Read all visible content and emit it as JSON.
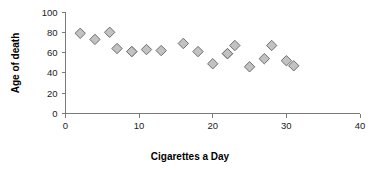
{
  "chart_data": {
    "type": "scatter",
    "title": "",
    "xlabel": "Cigarettes a Day",
    "ylabel": "Age of death",
    "xlim": [
      0,
      40
    ],
    "ylim": [
      0,
      100
    ],
    "xticks": [
      0,
      10,
      20,
      30,
      40
    ],
    "yticks": [
      0,
      20,
      40,
      60,
      80,
      100
    ],
    "grid": false,
    "legend": false,
    "marker": {
      "shape": "diamond",
      "fill": "#c2c2c2",
      "stroke": "#6f6f6f"
    },
    "series": [
      {
        "name": "Age of death vs cigarettes a day",
        "points": [
          {
            "x": 2,
            "y": 79
          },
          {
            "x": 4,
            "y": 73
          },
          {
            "x": 6,
            "y": 80
          },
          {
            "x": 7,
            "y": 64
          },
          {
            "x": 9,
            "y": 61
          },
          {
            "x": 11,
            "y": 63
          },
          {
            "x": 13,
            "y": 62
          },
          {
            "x": 16,
            "y": 69
          },
          {
            "x": 18,
            "y": 61
          },
          {
            "x": 20,
            "y": 49
          },
          {
            "x": 22,
            "y": 59
          },
          {
            "x": 23,
            "y": 67
          },
          {
            "x": 25,
            "y": 46
          },
          {
            "x": 27,
            "y": 54
          },
          {
            "x": 28,
            "y": 67
          },
          {
            "x": 30,
            "y": 52
          },
          {
            "x": 31,
            "y": 47
          },
          {
            "x": 22,
            "y": 59
          },
          {
            "x": 9,
            "y": 61
          }
        ]
      }
    ]
  },
  "axes": {
    "x_tick_labels": [
      "0",
      "10",
      "20",
      "30",
      "40"
    ],
    "y_tick_labels": [
      "0",
      "20",
      "40",
      "60",
      "80",
      "100"
    ],
    "x_title": "Cigarettes a Day",
    "y_title": "Age of death"
  }
}
